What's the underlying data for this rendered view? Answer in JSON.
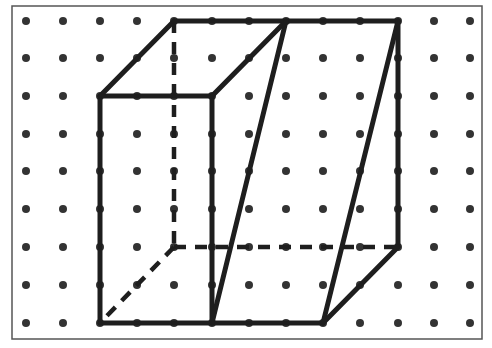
{
  "diagram": {
    "grid": {
      "columns": 13,
      "rows": 9,
      "x_positions": [
        26,
        63,
        100,
        137,
        174,
        212,
        249,
        286,
        323,
        360,
        398,
        434,
        470
      ],
      "y_positions": [
        21,
        58,
        96,
        134,
        171,
        209,
        247,
        285,
        323
      ],
      "dot_color": "#333333",
      "dot_radius": 4
    },
    "frame": {
      "x": 12,
      "y": 6,
      "width": 470,
      "height": 333,
      "color": "#555555"
    },
    "line_color": "#1e1e1e",
    "solid_edges": [
      {
        "from": [
          2,
          2
        ],
        "to": [
          5,
          2
        ]
      },
      {
        "from": [
          2,
          2
        ],
        "to": [
          2,
          8
        ]
      },
      {
        "from": [
          5,
          2
        ],
        "to": [
          5,
          8
        ]
      },
      {
        "from": [
          2,
          8
        ],
        "to": [
          8,
          8
        ]
      },
      {
        "from": [
          2,
          2
        ],
        "to": [
          4,
          0
        ]
      },
      {
        "from": [
          4,
          0
        ],
        "to": [
          10,
          0
        ]
      },
      {
        "from": [
          5,
          2
        ],
        "to": [
          7,
          0
        ]
      },
      {
        "from": [
          7,
          0
        ],
        "to": [
          5,
          8
        ]
      },
      {
        "from": [
          10,
          0
        ],
        "to": [
          8,
          8
        ]
      },
      {
        "from": [
          10,
          0
        ],
        "to": [
          10,
          6
        ]
      },
      {
        "from": [
          10,
          6
        ],
        "to": [
          8,
          8
        ]
      }
    ],
    "hidden_edges": [
      {
        "from": [
          4,
          0
        ],
        "to": [
          4,
          6
        ]
      },
      {
        "from": [
          4,
          6
        ],
        "to": [
          10,
          6
        ]
      },
      {
        "from": [
          4,
          6
        ],
        "to": [
          2,
          8
        ]
      }
    ]
  }
}
